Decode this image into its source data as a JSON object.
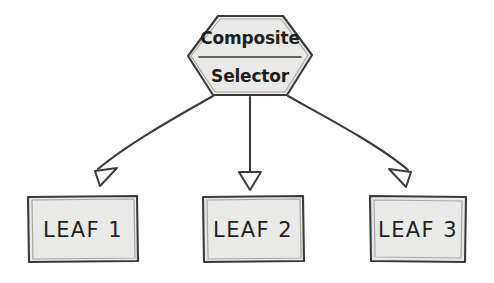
{
  "diagram": {
    "style": "hand-drawn whiteboard sketch",
    "background_color": "#ffffff",
    "node_fill_color": "#e9e9e7",
    "stroke_color": "#3d3d3d",
    "text_color": "#1f1f1f",
    "root": {
      "shape": "hexagon",
      "line1": "Composite",
      "line2": "Selector",
      "has_divider": true
    },
    "leaves": [
      {
        "label": "LEAF 1",
        "shape": "rectangle"
      },
      {
        "label": "LEAF 2",
        "shape": "rectangle"
      },
      {
        "label": "LEAF 3",
        "shape": "rectangle"
      }
    ],
    "connectors": [
      {
        "from": "Composite Selector",
        "to": "LEAF 1",
        "kind": "curved-arrow",
        "arrowhead": "hollow-triangle"
      },
      {
        "from": "Composite Selector",
        "to": "LEAF 2",
        "kind": "straight-arrow",
        "arrowhead": "hollow-triangle"
      },
      {
        "from": "Composite Selector",
        "to": "LEAF 3",
        "kind": "curved-arrow",
        "arrowhead": "hollow-triangle"
      }
    ]
  }
}
